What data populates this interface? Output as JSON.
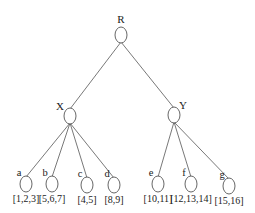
{
  "tree": {
    "root": {
      "id": "R",
      "label": "R",
      "x": 121,
      "y": 35
    },
    "internal": [
      {
        "id": "X",
        "label": "X",
        "x": 70,
        "y": 116,
        "parent": "R"
      },
      {
        "id": "Y",
        "label": "Y",
        "x": 174,
        "y": 115,
        "parent": "R"
      }
    ],
    "leaves": [
      {
        "id": "a",
        "label": "a",
        "x": 26,
        "y": 184,
        "parent": "X",
        "set": "[1,2,3]"
      },
      {
        "id": "b",
        "label": "b",
        "x": 52,
        "y": 184,
        "parent": "X",
        "set": "[5,6,7]"
      },
      {
        "id": "c",
        "label": "c",
        "x": 87,
        "y": 185,
        "parent": "X",
        "set": "[4,5]"
      },
      {
        "id": "d",
        "label": "d",
        "x": 114,
        "y": 185,
        "parent": "X",
        "set": "[8,9]"
      },
      {
        "id": "e",
        "label": "e",
        "x": 158,
        "y": 184,
        "parent": "Y",
        "set": "[10,11]"
      },
      {
        "id": "f",
        "label": "f",
        "x": 191,
        "y": 184,
        "parent": "Y",
        "set": "[12,13,14]"
      },
      {
        "id": "g",
        "label": "g",
        "x": 229,
        "y": 186,
        "parent": "Y",
        "set": "[15,16]"
      }
    ]
  },
  "style": {
    "stroke": "#555555",
    "node_fill": "#ffffff"
  }
}
